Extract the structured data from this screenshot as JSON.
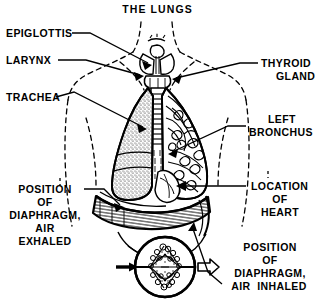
{
  "figure": {
    "title": "THE  LUNGS",
    "style": "black-and-white engraved line art on white background",
    "colors": {
      "ink": "#000000",
      "background": "#ffffff"
    }
  },
  "labels": {
    "epiglottis": "EPIGLOTTIS",
    "larynx": "LARYNX",
    "trachea": "TRACHEA",
    "thyroid_line1": "THYROID",
    "thyroid_line2": "GLAND",
    "left_bronchus_line1": "LEFT",
    "left_bronchus_line2": "BRONCHUS",
    "location_heart_line1": "LOCATION",
    "location_heart_line2": "OF",
    "location_heart_line3": "HEART",
    "diaphragm_exhaled_line1": "POSITION",
    "diaphragm_exhaled_line2": "OF",
    "diaphragm_exhaled_line3": "DIAPHRAGM,",
    "diaphragm_exhaled_line4": "AIR",
    "diaphragm_exhaled_line5": "EXHALED",
    "diaphragm_inhaled_line1": "POSITION",
    "diaphragm_inhaled_line2": "OF",
    "diaphragm_inhaled_line3": "DIAPHRAGM,",
    "diaphragm_inhaled_line4": "AIR  INHALED"
  },
  "parts": {
    "torso_outline": "dashed body silhouette with neck and shoulders",
    "right_lung": "stippled dotted texture lung on viewer left",
    "left_lung": "branching bronchial tree lung on viewer right",
    "trachea": "ringed windpipe descending from larynx",
    "diaphragm": "thick hatched curved muscle band below lungs",
    "alveolus_inset": "circular magnified alveolar sac detail",
    "inflow_arrow": "solid black arrow entering alveolus inset",
    "outflow_arrow": "hollow outline arrow leaving alveolus inset"
  }
}
